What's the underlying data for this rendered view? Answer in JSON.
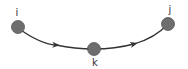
{
  "diagram": {
    "type": "path-graph",
    "nodes": [
      {
        "id": "i",
        "label": "i"
      },
      {
        "id": "k",
        "label": "k"
      },
      {
        "id": "j",
        "label": "j"
      }
    ],
    "edges": [
      {
        "from": "i",
        "to": "k",
        "directed": true
      },
      {
        "from": "k",
        "to": "j",
        "directed": true
      }
    ],
    "colors": {
      "node_fill": "#6e6e6e",
      "node_stroke": "#555555",
      "edge": "#333333",
      "label": "#333333"
    }
  }
}
